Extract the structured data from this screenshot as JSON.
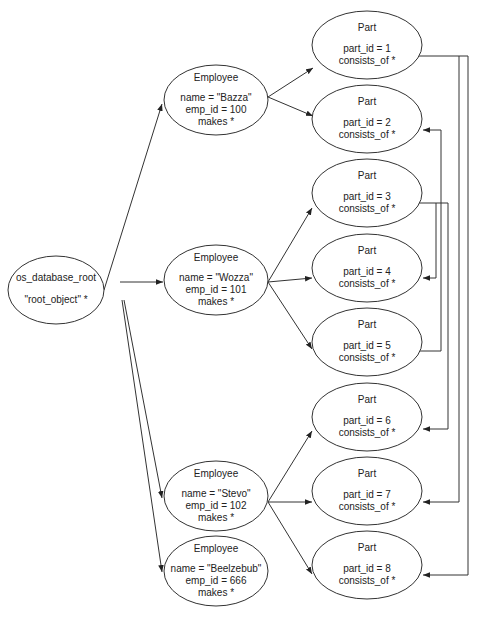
{
  "diagram": {
    "type": "object graph",
    "root": {
      "id": "root",
      "title": "os_database_root",
      "attrs": [
        "\"root_object\" *"
      ]
    },
    "employees": [
      {
        "id": "emp-bazza",
        "title": "Employee",
        "attrs": [
          "name = \"Bazza\"",
          "emp_id = 100",
          "makes *"
        ]
      },
      {
        "id": "emp-wozza",
        "title": "Employee",
        "attrs": [
          "name = \"Wozza\"",
          "emp_id = 101",
          "makes *"
        ]
      },
      {
        "id": "emp-stevo",
        "title": "Employee",
        "attrs": [
          "name = \"Stevo\"",
          "emp_id = 102",
          "makes *"
        ]
      },
      {
        "id": "emp-beelzebub",
        "title": "Employee",
        "attrs": [
          "name = \"Beelzebub\"",
          "emp_id = 666",
          "makes *"
        ]
      }
    ],
    "parts": [
      {
        "id": "part-1",
        "title": "Part",
        "attrs": [
          "part_id = 1",
          "consists_of *"
        ]
      },
      {
        "id": "part-2",
        "title": "Part",
        "attrs": [
          "part_id = 2",
          "consists_of *"
        ]
      },
      {
        "id": "part-3",
        "title": "Part",
        "attrs": [
          "part_id = 3",
          "consists_of *"
        ]
      },
      {
        "id": "part-4",
        "title": "Part",
        "attrs": [
          "part_id = 4",
          "consists_of *"
        ]
      },
      {
        "id": "part-5",
        "title": "Part",
        "attrs": [
          "part_id = 5",
          "consists_of *"
        ]
      },
      {
        "id": "part-6",
        "title": "Part",
        "attrs": [
          "part_id = 6",
          "consists_of *"
        ]
      },
      {
        "id": "part-7",
        "title": "Part",
        "attrs": [
          "part_id = 7",
          "consists_of *"
        ]
      },
      {
        "id": "part-8",
        "title": "Part",
        "attrs": [
          "part_id = 8",
          "consists_of *"
        ]
      }
    ],
    "edges": [
      {
        "from": "root",
        "to": "emp-bazza"
      },
      {
        "from": "root",
        "to": "emp-wozza"
      },
      {
        "from": "root",
        "to": "emp-stevo"
      },
      {
        "from": "root",
        "to": "emp-beelzebub"
      },
      {
        "from": "emp-bazza",
        "to": "part-1"
      },
      {
        "from": "emp-bazza",
        "to": "part-2"
      },
      {
        "from": "emp-wozza",
        "to": "part-3"
      },
      {
        "from": "emp-wozza",
        "to": "part-4"
      },
      {
        "from": "emp-wozza",
        "to": "part-5"
      },
      {
        "from": "emp-stevo",
        "to": "part-6"
      },
      {
        "from": "emp-stevo",
        "to": "part-7"
      },
      {
        "from": "emp-stevo",
        "to": "part-8"
      },
      {
        "from": "part-1",
        "to": "part-7"
      },
      {
        "from": "part-1",
        "to": "part-8"
      },
      {
        "from": "part-3",
        "to": "part-4"
      },
      {
        "from": "part-3",
        "to": "part-6"
      },
      {
        "from": "part-5",
        "to": "part-2"
      }
    ]
  }
}
